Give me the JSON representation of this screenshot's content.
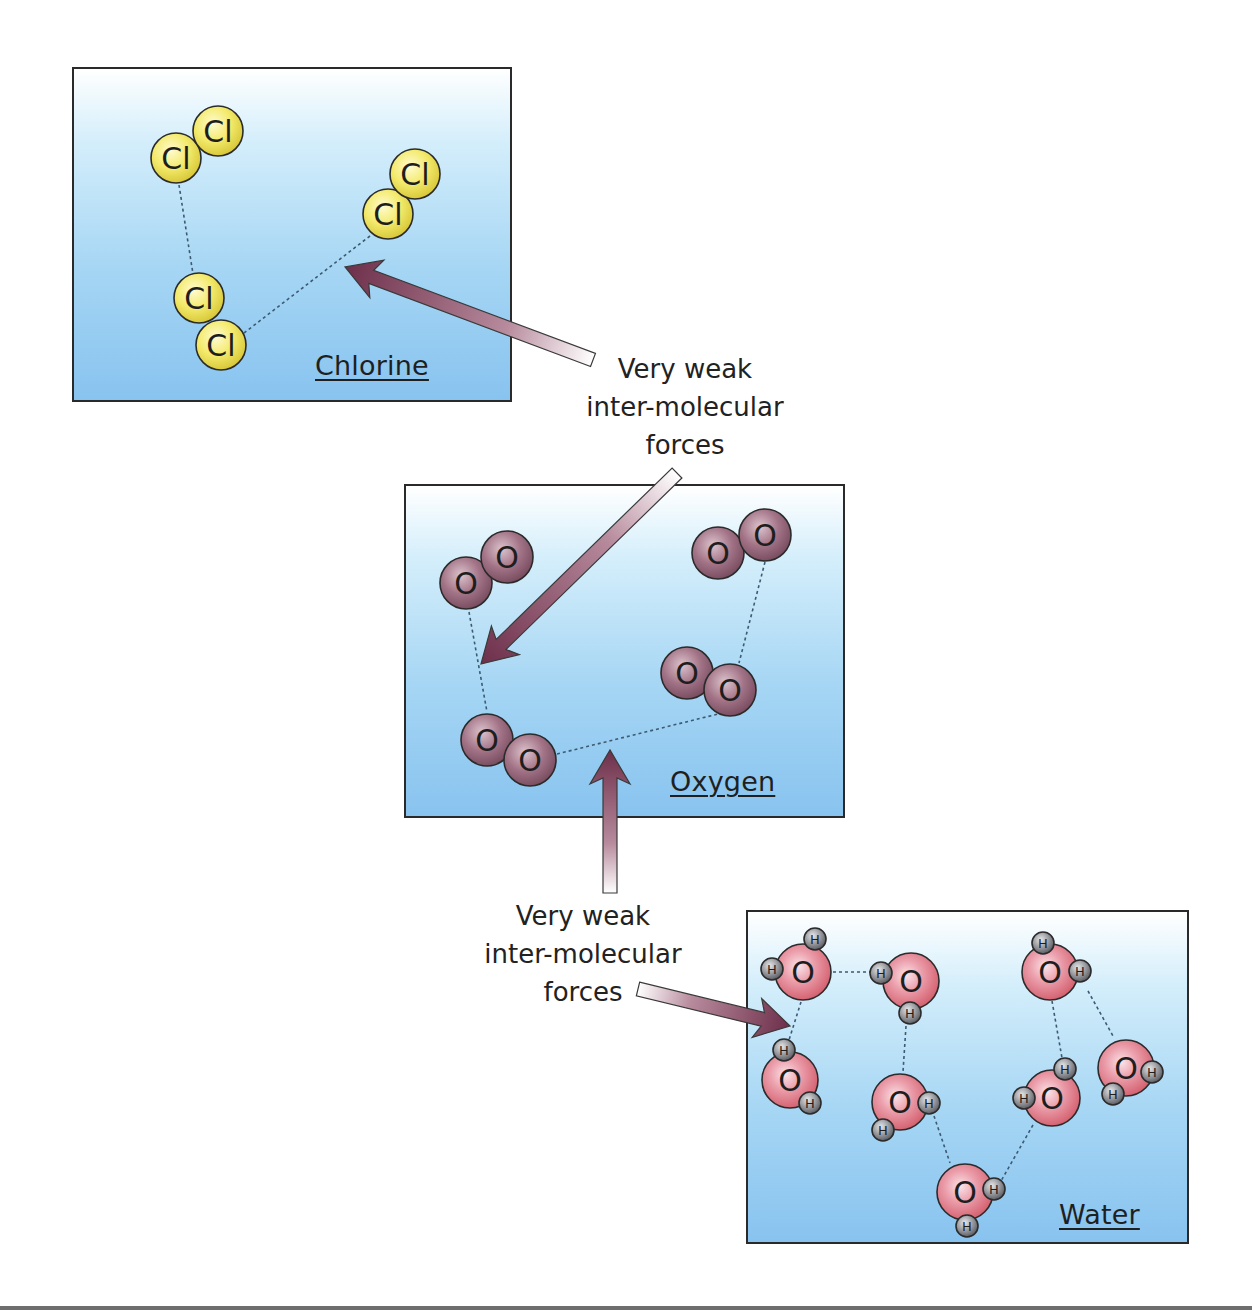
{
  "diagram": {
    "colors": {
      "panel_border": "#2a2a2a",
      "chlorine_atom": "#f3ea6c",
      "oxygen_molecule_atom": "#9e6f82",
      "water_oxygen_atom": "#e58797",
      "hydrogen_atom": "#8b8d92",
      "arrow": "#6d2f4a",
      "dashed_bond": "#3c5a72"
    },
    "panels": [
      {
        "id": "chlorine",
        "label": "Chlorine",
        "box": {
          "x": 72,
          "y": 67,
          "w": 440,
          "h": 335
        },
        "label_pos": {
          "x": 313,
          "y": 348
        },
        "atom_radius": 25,
        "atom_symbol": "Cl",
        "molecules": [
          {
            "atoms": [
              [
                176,
                158
              ],
              [
                218,
                131
              ]
            ]
          },
          {
            "atoms": [
              [
                388,
                214
              ],
              [
                415,
                174
              ]
            ]
          },
          {
            "atoms": [
              [
                199,
                298
              ],
              [
                221,
                345
              ]
            ]
          }
        ],
        "dashed_links": [
          [
            [
              179,
              185
            ],
            [
              193,
              274
            ]
          ],
          [
            [
              244,
              333
            ],
            [
              370,
              236
            ]
          ]
        ]
      },
      {
        "id": "oxygen",
        "label": "Oxygen",
        "box": {
          "x": 404,
          "y": 484,
          "w": 441,
          "h": 334
        },
        "label_pos": {
          "x": 668,
          "y": 764
        },
        "atom_radius": 26,
        "atom_symbol": "O",
        "molecules": [
          {
            "atoms": [
              [
                466,
                583
              ],
              [
                507,
                557
              ]
            ]
          },
          {
            "atoms": [
              [
                718,
                553
              ],
              [
                765,
                535
              ]
            ]
          },
          {
            "atoms": [
              [
                687,
                673
              ],
              [
                730,
                690
              ]
            ]
          },
          {
            "atoms": [
              [
                487,
                740
              ],
              [
                530,
                760
              ]
            ]
          }
        ],
        "dashed_links": [
          [
            [
              469,
              612
            ],
            [
              487,
              712
            ]
          ],
          [
            [
              765,
              562
            ],
            [
              739,
              663
            ]
          ],
          [
            [
              557,
              754
            ],
            [
              718,
              714
            ]
          ]
        ]
      },
      {
        "id": "water",
        "label": "Water",
        "box": {
          "x": 746,
          "y": 910,
          "w": 443,
          "h": 334
        },
        "label_pos": {
          "x": 1057,
          "y": 1197
        },
        "oxygen_radius": 28,
        "hydrogen_radius": 11,
        "oxygen_symbol": "O",
        "hydrogen_symbol": "H",
        "molecules": [
          {
            "o": [
              803,
              972
            ],
            "h": [
              [
                815,
                939
              ],
              [
                772,
                969
              ]
            ]
          },
          {
            "o": [
              911,
              981
            ],
            "h": [
              [
                881,
                973
              ],
              [
                910,
                1013
              ]
            ]
          },
          {
            "o": [
              1050,
              972
            ],
            "h": [
              [
                1043,
                943
              ],
              [
                1080,
                971
              ]
            ]
          },
          {
            "o": [
              790,
              1080
            ],
            "h": [
              [
                784,
                1050
              ],
              [
                810,
                1103
              ]
            ]
          },
          {
            "o": [
              900,
              1102
            ],
            "h": [
              [
                929,
                1103
              ],
              [
                883,
                1130
              ]
            ]
          },
          {
            "o": [
              1052,
              1098
            ],
            "h": [
              [
                1065,
                1069
              ],
              [
                1024,
                1098
              ]
            ]
          },
          {
            "o": [
              1126,
              1068
            ],
            "h": [
              [
                1152,
                1072
              ],
              [
                1113,
                1094
              ]
            ]
          },
          {
            "o": [
              965,
              1192
            ],
            "h": [
              [
                994,
                1189
              ],
              [
                967,
                1226
              ]
            ]
          }
        ],
        "dashed_links": [
          [
            [
              833,
              972
            ],
            [
              871,
              972
            ]
          ],
          [
            [
              801,
              1002
            ],
            [
              789,
              1040
            ]
          ],
          [
            [
              906,
              1026
            ],
            [
              903,
              1072
            ]
          ],
          [
            [
              1052,
              1001
            ],
            [
              1062,
              1058
            ]
          ],
          [
            [
              1088,
              991
            ],
            [
              1113,
              1036
            ]
          ],
          [
            [
              934,
              1116
            ],
            [
              950,
              1163
            ]
          ],
          [
            [
              1033,
              1125
            ],
            [
              1001,
              1181
            ]
          ]
        ]
      }
    ],
    "callouts": [
      {
        "id": "callout-top",
        "lines": [
          "Very weak",
          "inter-molecular",
          "forces"
        ],
        "pos": {
          "x": 560,
          "y": 350,
          "w": 250
        }
      },
      {
        "id": "callout-bottom",
        "lines": [
          "Very weak",
          "inter-molecular",
          "forces"
        ],
        "pos": {
          "x": 458,
          "y": 897,
          "w": 250
        }
      }
    ],
    "arrows": [
      {
        "id": "arrow-to-chlorine",
        "tail": [
          593,
          360
        ],
        "head": [
          345,
          267
        ]
      },
      {
        "id": "arrow-to-oxygen-left",
        "tail": [
          677,
          473
        ],
        "head": [
          481,
          664
        ]
      },
      {
        "id": "arrow-to-oxygen-bottom",
        "tail": [
          610,
          893
        ],
        "head": [
          610,
          750
        ]
      },
      {
        "id": "arrow-to-water",
        "tail": [
          638,
          989
        ],
        "head": [
          790,
          1026
        ]
      }
    ]
  }
}
